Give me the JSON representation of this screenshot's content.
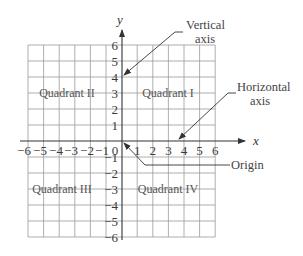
{
  "diagram": {
    "type": "coordinate-plane",
    "axes": {
      "x_label": "x",
      "y_label": "y",
      "x_range": [
        -6,
        6
      ],
      "y_range": [
        -6,
        6
      ],
      "origin_label": "0",
      "x_ticks_negative": [
        "−6",
        "−5",
        "−4",
        "−3",
        "−2",
        "−1"
      ],
      "x_ticks_positive": [
        "1",
        "2",
        "3",
        "4",
        "5",
        "6"
      ],
      "y_ticks_positive": [
        "6",
        "5",
        "4",
        "3",
        "2",
        "1"
      ],
      "y_ticks_negative": [
        "−1",
        "−2",
        "−3",
        "−4",
        "−5",
        "−6"
      ]
    },
    "quadrants": {
      "q1": "Quadrant I",
      "q2": "Quadrant II",
      "q3": "Quadrant III",
      "q4": "Quadrant IV"
    },
    "callouts": {
      "vertical_line1": "Vertical",
      "vertical_line2": "axis",
      "horizontal_line1": "Horizontal",
      "horizontal_line2": "axis",
      "origin": "Origin"
    }
  }
}
